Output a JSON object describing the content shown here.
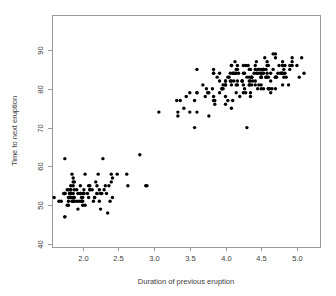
{
  "chart_data": {
    "type": "scatter",
    "title": "",
    "subtitle": "",
    "xlabel": "Duration of previous eruption",
    "ylabel": "Time to next eruption",
    "xlim": [
      1.6,
      5.35
    ],
    "ylim": [
      40,
      96
    ],
    "xticks": [
      2.0,
      2.5,
      3.0,
      3.5,
      4.0,
      4.5,
      5.0
    ],
    "xticklabels": [
      "2.0",
      "2.5",
      "3.0",
      "3.5",
      "4.0",
      "4.5",
      "5.0"
    ],
    "yticks": [
      40,
      50,
      60,
      70,
      80,
      90
    ],
    "yticklabels": [
      "40",
      "50",
      "60",
      "70",
      "80",
      "90"
    ],
    "grid": false,
    "legend": null,
    "marker": "filled-circle",
    "marker_color": "#000000",
    "marker_size": 1.7,
    "frame_color": "#999999",
    "background_color": "#ffffff",
    "n_points": 272,
    "x": [
      3.6,
      1.8,
      3.333,
      2.283,
      4.533,
      2.883,
      4.7,
      3.6,
      1.95,
      4.35,
      1.833,
      3.917,
      4.2,
      1.75,
      4.7,
      2.167,
      1.75,
      4.8,
      1.6,
      4.25,
      1.8,
      1.75,
      3.45,
      3.067,
      4.533,
      3.6,
      1.967,
      4.083,
      3.85,
      4.433,
      4.3,
      4.467,
      3.367,
      4.033,
      3.833,
      2.017,
      1.867,
      4.833,
      1.833,
      4.783,
      4.35,
      1.883,
      4.567,
      1.75,
      4.533,
      3.317,
      3.833,
      2.1,
      4.633,
      2.0,
      4.8,
      4.716,
      1.833,
      4.833,
      1.733,
      4.883,
      3.717,
      1.667,
      4.567,
      4.317,
      2.233,
      4.5,
      1.75,
      4.8,
      1.817,
      4.4,
      4.167,
      4.7,
      2.067,
      4.7,
      4.033,
      1.967,
      4.5,
      4.0,
      1.983,
      5.067,
      2.017,
      4.567,
      3.883,
      3.6,
      4.133,
      4.333,
      4.1,
      2.633,
      4.067,
      4.933,
      3.95,
      4.517,
      2.167,
      4.0,
      2.2,
      4.333,
      1.867,
      4.817,
      1.833,
      4.3,
      4.667,
      3.75,
      1.867,
      4.9,
      2.483,
      4.367,
      2.1,
      4.5,
      4.05,
      1.867,
      4.7,
      1.783,
      4.85,
      3.683,
      4.733,
      2.3,
      4.9,
      4.417,
      1.7,
      4.633,
      2.317,
      4.6,
      1.817,
      4.417,
      2.617,
      4.067,
      4.25,
      1.967,
      4.6,
      3.767,
      1.917,
      4.5,
      2.267,
      4.65,
      1.867,
      4.167,
      2.8,
      4.333,
      1.833,
      4.383,
      1.883,
      4.933,
      2.033,
      3.733,
      4.233,
      2.233,
      4.533,
      4.817,
      4.333,
      1.983,
      4.633,
      2.017,
      5.1,
      1.8,
      5.033,
      4.0,
      2.4,
      4.6,
      3.567,
      4.0,
      4.5,
      4.083,
      1.8,
      3.967,
      2.2,
      4.15,
      2.0,
      3.833,
      3.5,
      4.583,
      2.367,
      5.0,
      1.933,
      4.617,
      1.917,
      2.083,
      4.583,
      3.333,
      4.167,
      4.333,
      4.5,
      2.417,
      4.0,
      4.167,
      1.883,
      4.583,
      4.25,
      3.767,
      2.033,
      4.433,
      4.083,
      1.833,
      4.417,
      2.183,
      4.8,
      1.833,
      4.8,
      4.1,
      3.966,
      4.233,
      3.5,
      4.366,
      2.25,
      4.667,
      2.1,
      4.35,
      4.133,
      1.867,
      4.6,
      1.783,
      4.367,
      3.85,
      1.933,
      4.5,
      2.383,
      4.7,
      1.867,
      3.833,
      3.417,
      4.233,
      2.4,
      4.8,
      2.0,
      4.15,
      1.867,
      4.267,
      1.75,
      4.483,
      4.0,
      4.117,
      4.083,
      4.267,
      3.917,
      4.55,
      4.083,
      2.417,
      4.183,
      2.217,
      4.45,
      1.883,
      1.85,
      4.283,
      3.95,
      2.333,
      4.15,
      2.35,
      4.933,
      2.9,
      4.583,
      3.833,
      2.083,
      4.367,
      2.133,
      4.35,
      2.2,
      4.45,
      3.567,
      4.5,
      4.15,
      3.817,
      3.917,
      4.45,
      2.0,
      4.283,
      4.767,
      4.533,
      1.85,
      4.25,
      1.983,
      2.25,
      4.75,
      4.117,
      2.15,
      4.417,
      1.817,
      4.467
    ],
    "y": [
      79,
      54,
      74,
      62,
      85,
      55,
      88,
      85,
      51,
      85,
      54,
      84,
      78,
      47,
      83,
      52,
      62,
      84,
      52,
      79,
      51,
      47,
      78,
      74,
      85,
      79,
      55,
      86,
      77,
      84,
      70,
      81,
      77,
      77,
      84,
      53,
      52,
      86,
      55,
      84,
      79,
      54,
      83,
      53,
      80,
      77,
      84,
      54,
      79,
      53,
      81,
      83,
      53,
      84,
      53,
      81,
      78,
      51,
      85,
      86,
      54,
      80,
      53,
      84,
      53,
      84,
      82,
      80,
      53,
      89,
      83,
      53,
      84,
      78,
      52,
      88,
      53,
      83,
      83,
      74,
      84,
      85,
      77,
      55,
      84,
      87,
      80,
      84,
      52,
      82,
      55,
      81,
      53,
      85,
      52,
      83,
      85,
      79,
      56,
      86,
      58,
      83,
      55,
      83,
      83,
      57,
      83,
      54,
      83,
      81,
      84,
      54,
      85,
      86,
      51,
      84,
      55,
      86,
      52,
      82,
      58,
      82,
      81,
      53,
      80,
      79,
      54,
      83,
      53,
      80,
      55,
      86,
      63,
      83,
      54,
      82,
      51,
      86,
      58,
      80,
      82,
      51,
      84,
      83,
      82,
      51,
      82,
      54,
      84,
      50,
      83,
      76,
      58,
      80,
      77,
      81,
      81,
      82,
      52,
      80,
      53,
      79,
      52,
      78,
      79,
      86,
      55,
      86,
      53,
      80,
      51,
      55,
      83,
      73,
      85,
      81,
      83,
      52,
      81,
      81,
      52,
      87,
      84,
      73,
      50,
      87,
      81,
      52,
      81,
      56,
      87,
      53,
      86,
      84,
      81,
      82,
      74,
      83,
      49,
      89,
      54,
      78,
      87,
      52,
      83,
      50,
      83,
      76,
      49,
      83,
      51,
      83,
      51,
      85,
      75,
      82,
      56,
      86,
      50,
      84,
      51,
      80,
      53,
      84,
      82,
      84,
      86,
      84,
      82,
      88,
      75,
      57,
      84,
      58,
      80,
      56,
      58,
      79,
      80,
      53,
      85,
      48,
      88,
      55,
      84,
      77,
      52,
      81,
      54,
      82,
      53,
      84,
      70,
      85,
      81,
      80,
      79,
      85,
      51,
      86,
      84,
      85,
      51,
      86,
      51,
      53,
      86,
      82,
      51,
      85,
      53,
      85
    ],
    "points_note": "Old Faithful geyser: eruption duration (minutes) vs waiting time to next eruption (minutes)"
  },
  "axes": {
    "x_axis_label": "Duration of previous eruption",
    "y_axis_label": "Time to next eruption",
    "x_tick_labels": [
      "2.0",
      "2.5",
      "3.0",
      "3.5",
      "4.0",
      "4.5",
      "5.0"
    ],
    "y_tick_labels": [
      "40",
      "50",
      "60",
      "70",
      "80",
      "90"
    ]
  },
  "geometry": {
    "plot_left": 52,
    "plot_right": 320,
    "plot_top": 15,
    "plot_bottom": 247,
    "x_at_2": 82.7,
    "px_per_x_unit": 71.4,
    "y_at_40": 244,
    "px_per_y_unit": 3.88
  },
  "colors": {
    "point": "#000000",
    "frame": "#999999",
    "text": "#3c3c3c",
    "background": "#ffffff"
  }
}
